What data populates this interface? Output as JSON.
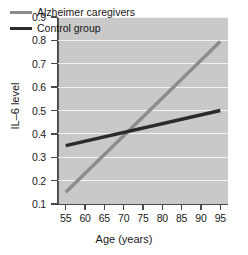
{
  "chart_data": {
    "type": "line",
    "title": "",
    "xlabel": "Age (years)",
    "ylabel": "IL–6 level",
    "xlim": [
      53,
      97
    ],
    "ylim": [
      0.1,
      0.9
    ],
    "xticks": [
      55,
      60,
      65,
      70,
      75,
      80,
      85,
      90,
      95
    ],
    "yticks": [
      0.1,
      0.2,
      0.3,
      0.4,
      0.5,
      0.6,
      0.7,
      0.8,
      0.9
    ],
    "xtick_labels": [
      "55",
      "60",
      "65",
      "70",
      "75",
      "80",
      "85",
      "90",
      "95"
    ],
    "ytick_labels": [
      "0.1",
      "0.2",
      "0.3",
      "0.4",
      "0.5",
      "0.6",
      "0.7",
      "0.8",
      "0.9"
    ],
    "grid": "horizontal",
    "grid_color": "#f2f2f2",
    "plot_background": "#c9c9c9",
    "legend_position": "upper-left-inside",
    "x": [
      55,
      95
    ],
    "series": [
      {
        "name": "Alzheimer caregivers",
        "color": "#8c8c8c",
        "values": [
          0.15,
          0.795
        ],
        "linewidth": 3.4
      },
      {
        "name": "Control group",
        "color": "#2b2b2b",
        "values": [
          0.35,
          0.5
        ],
        "linewidth": 3.4
      }
    ],
    "annotations": [
      {
        "text": "lines intersect near age 71 at IL-6 level 0.41",
        "x": 71,
        "y": 0.41
      }
    ]
  },
  "legend": {
    "items": [
      {
        "label": "Alzheimer caregivers",
        "color": "#8c8c8c"
      },
      {
        "label": "Control group",
        "color": "#2b2b2b"
      }
    ]
  }
}
